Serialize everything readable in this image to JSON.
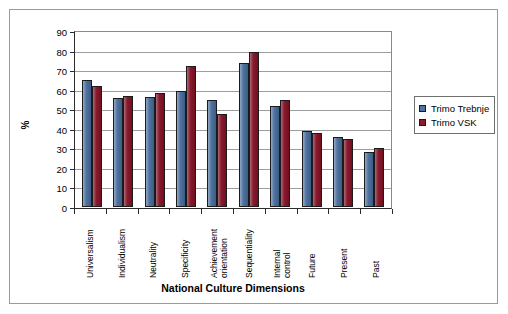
{
  "chart_data": {
    "type": "bar",
    "title": "",
    "xlabel": "National Culture Dimensions",
    "ylabel": "%",
    "ylim": [
      0,
      90
    ],
    "ytick_step": 10,
    "yticks": [
      90,
      80,
      70,
      60,
      50,
      40,
      30,
      20,
      10,
      0
    ],
    "grid": true,
    "legend_position": "right",
    "categories": [
      "Universalism",
      "Individualism",
      "Neutrality",
      "Specificity",
      "Achievement orientation",
      "Sequentiality",
      "Internal control",
      "Future",
      "Present",
      "Past"
    ],
    "category_lines": [
      [
        "Universalism"
      ],
      [
        "Individualism"
      ],
      [
        "Neutrality"
      ],
      [
        "Specificity"
      ],
      [
        "Achievement",
        "orientation"
      ],
      [
        "Sequentiality"
      ],
      [
        "Internal",
        "control"
      ],
      [
        "Future"
      ],
      [
        "Present"
      ],
      [
        "Past"
      ]
    ],
    "series": [
      {
        "name": "Trimo Trebnje",
        "color": "#4f739f",
        "values": [
          65,
          56,
          56.5,
          59.5,
          54.5,
          73.5,
          51.5,
          39,
          36,
          28
        ]
      },
      {
        "name": "Trimo VSK",
        "color": "#8b1a2e",
        "values": [
          62,
          57,
          58.5,
          72,
          47.5,
          79.5,
          54.5,
          38,
          35,
          30
        ]
      }
    ]
  },
  "legend": {
    "items": [
      {
        "label": "Trimo Trebnje",
        "color": "#4f739f"
      },
      {
        "label": "Trimo VSK",
        "color": "#8b1a2e"
      }
    ]
  },
  "axes": {
    "y_title": "%",
    "x_title": "National Culture Dimensions"
  }
}
